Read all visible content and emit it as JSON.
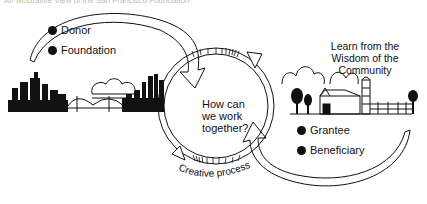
{
  "caption": "An Illustrative View of the San Francisco Foundation",
  "center_question": [
    "How can",
    "we work",
    "together?"
  ],
  "left_group": {
    "items": [
      {
        "bullet_icon": "filled-circle",
        "label": "Donor"
      },
      {
        "bullet_icon": "filled-circle",
        "label": "Foundation"
      }
    ],
    "illustration": "city-skyline-with-bridge"
  },
  "right_group": {
    "heading": [
      "Learn from the",
      "Wisdom of the Community"
    ],
    "items": [
      {
        "bullet_icon": "filled-circle",
        "label": "Grantee"
      },
      {
        "bullet_icon": "filled-circle",
        "label": "Beneficiary"
      }
    ],
    "illustration": "farm-barn-silo-trees"
  },
  "cycle_label": "Creative process",
  "colors": {
    "ink": "#111111",
    "paper": "#ffffff",
    "caption": "#bbbbbb"
  }
}
